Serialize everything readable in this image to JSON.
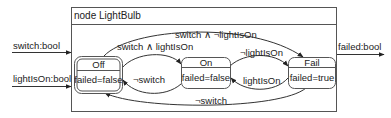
{
  "node": {
    "title": "node LightBulb"
  },
  "inputs": [
    {
      "label": "switch:bool"
    },
    {
      "label": "lightIsOn:bool"
    }
  ],
  "outputs": [
    {
      "label": "failed:bool"
    }
  ],
  "states": [
    {
      "name": "Off",
      "body": "failed=false",
      "initial": true
    },
    {
      "name": "On",
      "body": "failed=false",
      "initial": false
    },
    {
      "name": "Fail",
      "body": "failed=true",
      "initial": false
    }
  ],
  "transitions": [
    {
      "from": "Off",
      "to": "On",
      "label": "switch ∧ lightIsOn"
    },
    {
      "from": "Off",
      "to": "Fail",
      "label": "switch ∧ ¬lightIsOn"
    },
    {
      "from": "On",
      "to": "Off",
      "label": "¬switch"
    },
    {
      "from": "On",
      "to": "Fail",
      "label": "¬lightIsOn"
    },
    {
      "from": "Fail",
      "to": "On",
      "label": "lightIsOn"
    },
    {
      "from": "Fail",
      "to": "Off",
      "label": "¬switch"
    }
  ],
  "colors": {
    "line": "#333333",
    "background": "#ffffff",
    "text": "#222222"
  }
}
